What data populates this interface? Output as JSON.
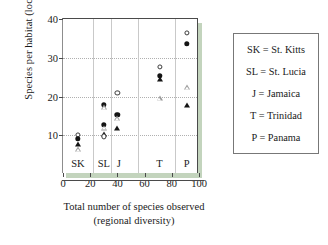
{
  "chart_data": {
    "type": "scatter",
    "title": "",
    "xlabel": "Total number of species observed (regional diversity)",
    "xlabel_line1": "Total number of species observed",
    "xlabel_line2": "(regional diversity)",
    "ylabel": "Species per habitat (local diversity)",
    "xlim": [
      0,
      100
    ],
    "ylim": [
      0,
      40
    ],
    "xticks": [
      0,
      20,
      40,
      60,
      80,
      100
    ],
    "yticks": [
      10,
      20,
      30,
      40
    ],
    "grid": "horizontal-dotted",
    "legend_position": "right-outside-box",
    "group_dividers_x": [
      22,
      35,
      55,
      82
    ],
    "groups": [
      {
        "code": "SK",
        "label_x": 11,
        "regional_diversity": 11,
        "points": [
          {
            "series": "open-circle",
            "x": 11,
            "y": 10.0
          },
          {
            "series": "filled-circle",
            "x": 11,
            "y": 9.1
          },
          {
            "series": "filled-triangle",
            "x": 11,
            "y": 7.7
          },
          {
            "series": "open-triangle",
            "x": 11,
            "y": 6.4
          }
        ]
      },
      {
        "code": "SL",
        "label_x": 30,
        "regional_diversity": 30,
        "points": [
          {
            "series": "filled-circle",
            "x": 30,
            "y": 17.9
          },
          {
            "series": "open-triangle",
            "x": 30,
            "y": 17.2
          },
          {
            "series": "filled-circle",
            "x": 30,
            "y": 12.7
          },
          {
            "series": "open-triangle",
            "x": 30,
            "y": 11.9
          },
          {
            "series": "filled-triangle",
            "x": 30,
            "y": 10.4
          },
          {
            "series": "open-circle",
            "x": 30,
            "y": 9.7
          }
        ]
      },
      {
        "code": "J",
        "label_x": 41,
        "regional_diversity": 40,
        "points": [
          {
            "series": "open-circle",
            "x": 40,
            "y": 20.9
          },
          {
            "series": "filled-circle",
            "x": 40,
            "y": 15.2
          },
          {
            "series": "open-triangle",
            "x": 40,
            "y": 14.4
          },
          {
            "series": "filled-triangle",
            "x": 40,
            "y": 11.8
          }
        ]
      },
      {
        "code": "T",
        "label_x": 71,
        "regional_diversity": 71,
        "points": [
          {
            "series": "open-circle",
            "x": 71,
            "y": 27.6
          },
          {
            "series": "filled-circle",
            "x": 71,
            "y": 25.4
          },
          {
            "series": "filled-triangle",
            "x": 71,
            "y": 24.6
          },
          {
            "series": "open-triangle",
            "x": 71,
            "y": 19.6
          }
        ]
      },
      {
        "code": "P",
        "label_x": 91,
        "regional_diversity": 91,
        "points": [
          {
            "series": "open-circle",
            "x": 91,
            "y": 36.5
          },
          {
            "series": "filled-circle",
            "x": 91,
            "y": 33.6
          },
          {
            "series": "open-triangle",
            "x": 91,
            "y": 22.4
          },
          {
            "series": "filled-triangle",
            "x": 91,
            "y": 17.8
          }
        ]
      }
    ]
  },
  "legend": {
    "rows": [
      "SK = St. Kitts",
      "SL = St. Lucia",
      "J = Jamaica",
      "T = Trinidad",
      "P = Panama"
    ]
  },
  "colors": {
    "marker_fill": "#141414",
    "marker_open_stroke": "#3a3a3a",
    "axis": "#4a4a4a",
    "grid": "#b0b0b0",
    "shadow_green": "#b9cdb2",
    "background": "#ffffff"
  }
}
